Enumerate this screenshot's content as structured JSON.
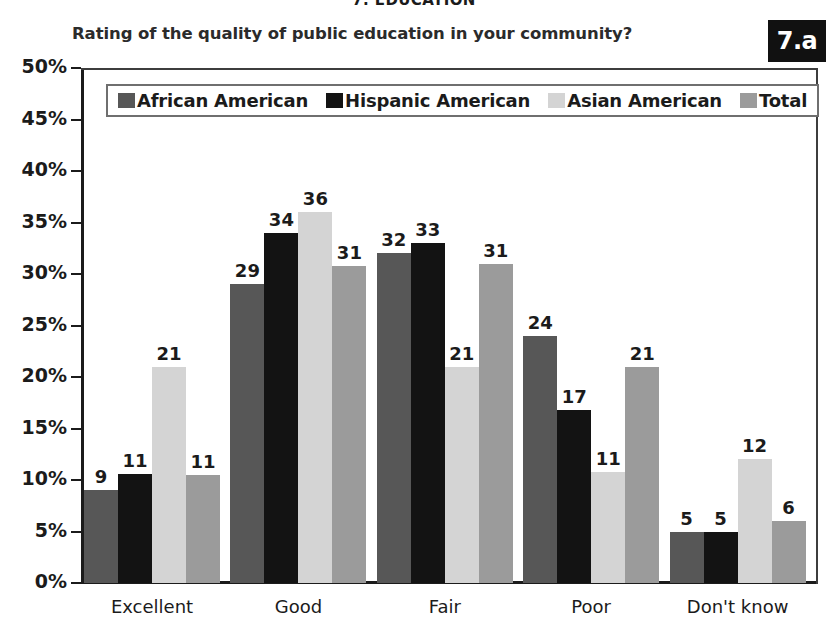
{
  "section_header": "7. EDUCATION",
  "badge": "7.a",
  "chart_data": {
    "type": "bar",
    "title": "Rating of the quality of public education in your community?",
    "xlabel": "",
    "ylabel": "",
    "ylim": [
      0,
      50
    ],
    "ytick_labels": [
      "50%",
      "45%",
      "40%",
      "35%",
      "30%",
      "25%",
      "20%",
      "15%",
      "10%",
      "5%",
      "0%"
    ],
    "ytick_values": [
      50,
      45,
      40,
      35,
      30,
      25,
      20,
      15,
      10,
      5,
      0
    ],
    "grid": false,
    "legend_position": "top-left-inside",
    "categories": [
      "Excellent",
      "Good",
      "Fair",
      "Poor",
      "Don't know"
    ],
    "series": [
      {
        "name": "African American",
        "color": "#575757",
        "values": [
          9,
          29,
          32,
          24,
          5
        ],
        "labels": [
          "9",
          "29",
          "32",
          "24",
          "5"
        ]
      },
      {
        "name": "Hispanic American",
        "color": "#131313",
        "values": [
          10.6,
          34,
          33,
          16.8,
          5
        ],
        "labels": [
          "11",
          "34",
          "33",
          "17",
          "5"
        ]
      },
      {
        "name": "Asian American",
        "color": "#d4d4d4",
        "values": [
          21,
          36,
          21,
          10.8,
          12
        ],
        "labels": [
          "21",
          "36",
          "21",
          "11",
          "12"
        ]
      },
      {
        "name": "Total",
        "color": "#9b9b9b",
        "values": [
          10.5,
          30.8,
          31,
          21,
          6
        ],
        "labels": [
          "11",
          "31",
          "31",
          "21",
          "6"
        ]
      }
    ]
  }
}
